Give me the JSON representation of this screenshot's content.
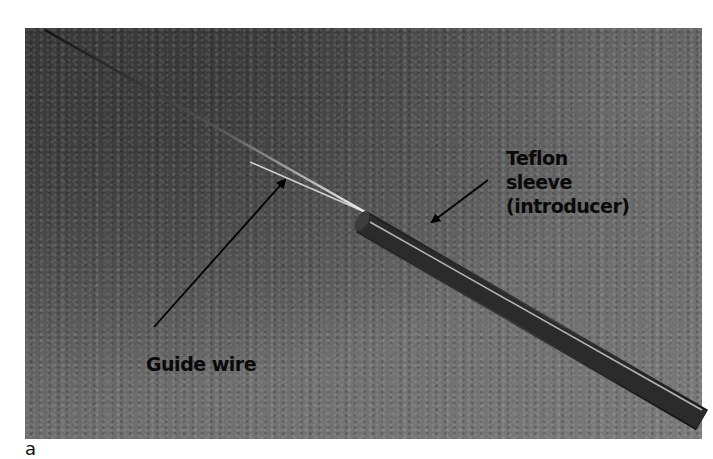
{
  "figure": {
    "panel_letter": "a",
    "labels": {
      "guide_wire": "Guide wire",
      "teflon_line1": "Teflon",
      "teflon_line2": "sleeve",
      "teflon_line3": "(introducer)"
    },
    "colors": {
      "background": "#ffffff",
      "label_text": "#0a0a0a",
      "wire_highlight": "#e8e8e8",
      "sleeve": "#2a2a2a"
    }
  }
}
